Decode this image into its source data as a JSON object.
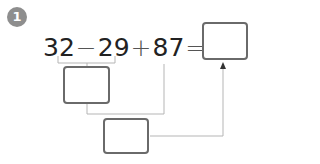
{
  "problem": {
    "number": "1",
    "terms": {
      "a": "32",
      "op1": "−",
      "b": "29",
      "op2": "+",
      "c": "87",
      "eq": "="
    },
    "boxes": {
      "intermediate_1": "",
      "intermediate_2": "",
      "final_answer": ""
    }
  },
  "colors": {
    "badge": "#8e8e8e",
    "box_border": "#6a6a6a",
    "connector": "#b5b5b5"
  }
}
